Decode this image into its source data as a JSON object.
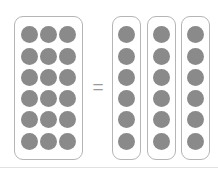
{
  "figure": {
    "type": "grouping-model-diagram",
    "equation_text": "18 = 6 + 6 + 6",
    "background_color": "#ffffff"
  },
  "style": {
    "dot_color": "#8a8a8a",
    "panel_border_color": "#b5b5b5",
    "panel_fill_color": "#ffffff",
    "divider_color": "#e2e2e2",
    "operator_color": "#9a9a9a"
  },
  "whole_group": {
    "label": "whole-group",
    "total": 18,
    "columns": 3,
    "rows": 6,
    "row_counts": [
      3,
      3,
      3,
      3,
      3,
      3
    ]
  },
  "operator": {
    "symbol": "=",
    "name": "equals-sign"
  },
  "part_groups": [
    {
      "label": "part-group-1",
      "count": 6
    },
    {
      "label": "part-group-2",
      "count": 6
    },
    {
      "label": "part-group-3",
      "count": 6
    }
  ],
  "divider": {
    "name": "bottom-divider",
    "visible": true
  }
}
